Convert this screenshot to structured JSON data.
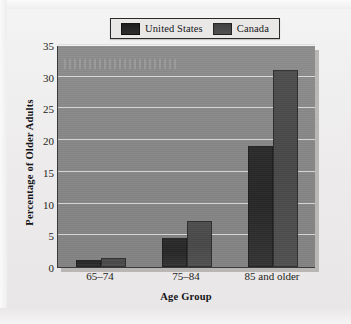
{
  "chart_data": {
    "type": "bar",
    "title": "",
    "xlabel": "Age Group",
    "ylabel": "Percentage of Older Adults",
    "categories": [
      "65–74",
      "75–84",
      "85 and older"
    ],
    "series": [
      {
        "name": "United States",
        "color": "#282828",
        "values": [
          1.1,
          4.5,
          19.1
        ]
      },
      {
        "name": "Canada",
        "color": "#4a4a4a",
        "values": [
          1.4,
          7.3,
          31.0
        ]
      }
    ],
    "ylim": [
      0,
      35
    ],
    "ytick_values": [
      0,
      5,
      10,
      15,
      20,
      25,
      30,
      35
    ],
    "ytick_labels": [
      "0",
      "5",
      "10",
      "15",
      "20",
      "25",
      "30",
      "35"
    ],
    "grid": true,
    "grid_color": "#ddddda",
    "legend_position": "top-center",
    "plot_background": "#878787",
    "figure_background": "#eeecec"
  },
  "legend": {
    "entries": [
      {
        "label": "United States",
        "swatch": "legend-swatch-united-states"
      },
      {
        "label": "Canada",
        "swatch": "legend-swatch-canada"
      }
    ]
  }
}
